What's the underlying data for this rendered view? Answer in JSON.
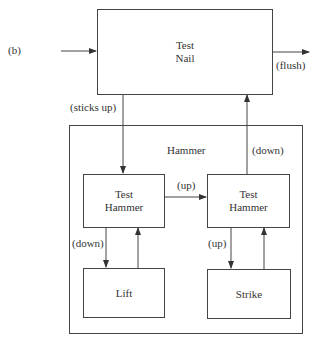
{
  "figure": {
    "panel_label": "(b)",
    "test_nail": {
      "line1": "Test",
      "line2": "Nail"
    },
    "flush_label": "(flush)",
    "sticks_up_label": "(sticks up)",
    "hammer_group": {
      "title": "Hammer",
      "down_return_label": "(down)",
      "test_hammer_left": {
        "line1": "Test",
        "line2": "Hammer"
      },
      "test_hammer_right": {
        "line1": "Test",
        "line2": "Hammer"
      },
      "up_between_label": "(up)",
      "left_down_label": "(down)",
      "right_up_label": "(up)",
      "lift": "Lift",
      "strike": "Strike"
    }
  }
}
